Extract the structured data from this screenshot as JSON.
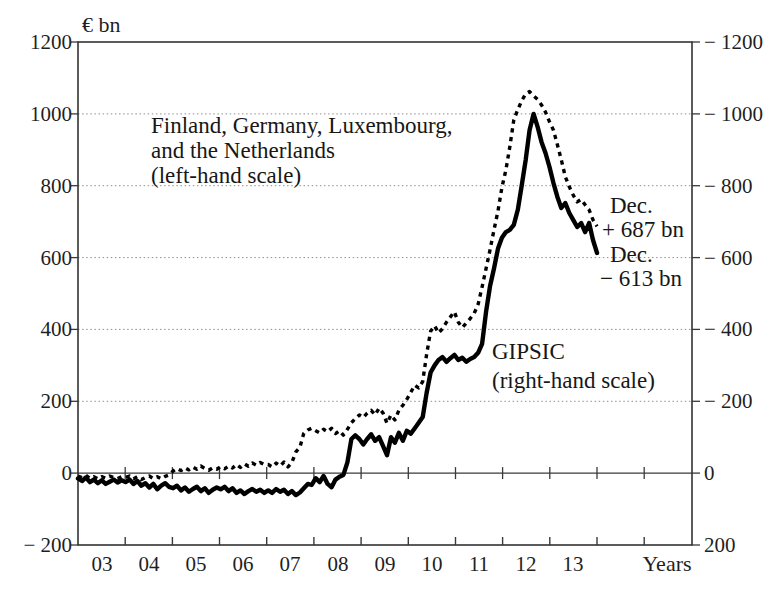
{
  "figure": {
    "unit_label": "€ bn",
    "x_axis_title": "Years"
  },
  "chart_data": {
    "type": "line",
    "x": {
      "start_year": 2003,
      "end_year": 2013,
      "frequency": "monthly",
      "tick_labels": [
        "03",
        "04",
        "05",
        "06",
        "07",
        "08",
        "09",
        "10",
        "11",
        "12",
        "13"
      ]
    },
    "y_left": {
      "min": -200,
      "max": 1200,
      "tick_interval": 200,
      "tick_values": [
        1200,
        1000,
        800,
        600,
        400,
        200,
        0,
        -200
      ],
      "tick_labels": [
        "1200",
        "1000",
        "800",
        "600",
        "400",
        "200",
        "0",
        "− 200"
      ]
    },
    "y_right": {
      "min": -1200,
      "max": 200,
      "tick_interval": 200,
      "tick_values": [
        -1200,
        -1000,
        -800,
        -600,
        -400,
        -200,
        0,
        200
      ],
      "tick_labels": [
        "− 1200",
        "− 1000",
        "− 800",
        "− 600",
        "− 400",
        "− 200",
        "0",
        "200"
      ],
      "note": "inverted mirror of left scale"
    },
    "grid": {
      "dotted_levels": [
        200,
        400,
        600,
        800,
        1000
      ],
      "zero_line": true
    },
    "series": [
      {
        "name": "Finland, Germany, Luxembourg, and the Netherlands",
        "scale": "left",
        "line_style": "dashed",
        "color": "#000000",
        "end_value_bn": 687,
        "monthly_values": [
          -8,
          -12,
          -6,
          -14,
          -10,
          -16,
          -10,
          -14,
          -8,
          -12,
          -15,
          -10,
          -12,
          -8,
          -16,
          -10,
          -18,
          -12,
          -8,
          -15,
          -10,
          -16,
          -9,
          -5,
          6,
          13,
          7,
          15,
          9,
          17,
          11,
          20,
          13,
          8,
          15,
          11,
          18,
          12,
          20,
          14,
          24,
          16,
          26,
          19,
          28,
          22,
          30,
          24,
          24,
          17,
          28,
          20,
          31,
          17,
          30,
          59,
          72,
          111,
          120,
          125,
          118,
          112,
          122,
          115,
          125,
          110,
          118,
          106,
          122,
          140,
          152,
          162,
          155,
          167,
          175,
          162,
          181,
          167,
          139,
          162,
          148,
          175,
          189,
          205,
          225,
          245,
          237,
          255,
          330,
          395,
          410,
          390,
          402,
          420,
          435,
          449,
          420,
          405,
          418,
          430,
          445,
          470,
          518,
          570,
          621,
          677,
          730,
          795,
          844,
          908,
          983,
          1012,
          1036,
          1056,
          1062,
          1050,
          1040,
          1025,
          1005,
          978,
          955,
          914,
          872,
          825,
          797,
          774,
          755,
          762,
          747,
          733,
          705,
          687
        ]
      },
      {
        "name": "GIPSIC",
        "scale": "right",
        "line_style": "solid",
        "color": "#000000",
        "end_value_bn": -613,
        "monthly_values": [
          15,
          22,
          12,
          25,
          18,
          28,
          20,
          30,
          24,
          18,
          26,
          20,
          25,
          18,
          30,
          22,
          35,
          28,
          40,
          30,
          45,
          35,
          28,
          38,
          42,
          35,
          48,
          40,
          52,
          44,
          38,
          50,
          42,
          55,
          46,
          40,
          45,
          38,
          50,
          42,
          55,
          48,
          58,
          50,
          44,
          52,
          46,
          55,
          48,
          55,
          44,
          52,
          46,
          58,
          50,
          61,
          54,
          42,
          30,
          33,
          14,
          25,
          8,
          30,
          39,
          18,
          10,
          5,
          -30,
          -95,
          -105,
          -95,
          -80,
          -95,
          -108,
          -90,
          -100,
          -75,
          -50,
          -100,
          -85,
          -112,
          -90,
          -118,
          -110,
          -125,
          -140,
          -156,
          -223,
          -280,
          -300,
          -315,
          -323,
          -310,
          -320,
          -329,
          -315,
          -321,
          -310,
          -318,
          -323,
          -335,
          -360,
          -450,
          -520,
          -570,
          -625,
          -655,
          -671,
          -677,
          -691,
          -733,
          -800,
          -872,
          -955,
          -1000,
          -964,
          -922,
          -891,
          -852,
          -808,
          -769,
          -738,
          -752,
          -724,
          -705,
          -685,
          -696,
          -671,
          -696,
          -649,
          -613
        ]
      }
    ],
    "annotations": {
      "series1_label": {
        "line1": "Finland, Germany, Luxembourg,",
        "line2": "and the Netherlands",
        "line3": "(left-hand scale)"
      },
      "series2_label": {
        "line1": "GIPSIC",
        "line2": "(right-hand scale)"
      },
      "end1": {
        "line1": "Dec.",
        "line2": "+ 687 bn"
      },
      "end2": {
        "line1": "Dec.",
        "line2": "− 613 bn"
      }
    }
  }
}
